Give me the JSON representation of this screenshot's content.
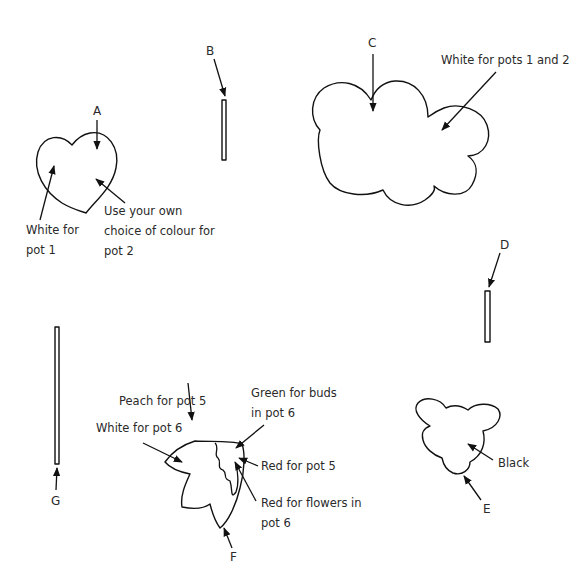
{
  "diagram": {
    "pieces": [
      {
        "id": "A",
        "shape": "heart"
      },
      {
        "id": "B",
        "shape": "short-stick"
      },
      {
        "id": "C",
        "shape": "cloud"
      },
      {
        "id": "D",
        "shape": "short-stick"
      },
      {
        "id": "E",
        "shape": "bear-head"
      },
      {
        "id": "F",
        "shape": "flower-cluster"
      },
      {
        "id": "G",
        "shape": "long-stick"
      }
    ],
    "letters": {
      "A": "A",
      "B": "B",
      "C": "C",
      "D": "D",
      "E": "E",
      "F": "F",
      "G": "G"
    },
    "notes": {
      "a_white": [
        "White for",
        "pot 1"
      ],
      "a_own": [
        "Use your own",
        "choice of colour for",
        "pot 2"
      ],
      "c_white": "White for pots 1 and 2",
      "e_black": "Black",
      "f_peach": "Peach for pot 5",
      "f_white": "White for pot 6",
      "f_green": [
        "Green for buds",
        "in pot 6"
      ],
      "f_red5": "Red for pot 5",
      "f_red6": [
        "Red for flowers in",
        "pot 6"
      ]
    }
  }
}
